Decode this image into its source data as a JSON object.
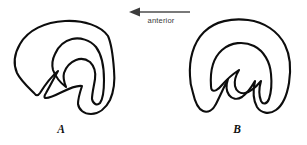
{
  "figure": {
    "background_color": "#ffffff",
    "ink_color": "#0d0d0d",
    "annotation_color": "#3a3a3a",
    "width": 307,
    "height": 145
  },
  "direction_indicator": {
    "label": "anterior",
    "arrow_points": "left",
    "line_x_start": 190,
    "line_x_end": 131,
    "line_y": 12,
    "label_x": 161,
    "label_y": 22
  },
  "panels": [
    {
      "id": "A",
      "label": "A",
      "label_x": 61,
      "label_y": 133,
      "outer_path": "M 108 36 C 101 26 84 20 65 21 C 45 22 28 30 20 44 C 13 56 14 66 17 73 C 21 81 29 88 34 93 C 36 96 38 96 40 93 C 45 85 52 76 58 71 C 53 80 49 88 46 93 C 44 96 44 98 46 98 C 50 98 56 95 62 92 C 70 88 77 85 82 86 C 80 92 78 99 78 104 C 79 110 84 114 91 114 C 99 114 106 108 110 100 C 114 91 115 80 114 70 C 113 56 112 45 108 36 Z",
      "inner_path": "M 96 47 C 90 40 80 37 72 39 C 64 41 58 47 55 54 C 52 60 52 66 53 70 C 56 78 62 84 66 87 C 64 82 63 77 64 73 C 66 67 71 62 76 60 C 81 58 86 59 90 62 C 94 66 96 72 95 79 C 94 86 92 93 92 99 C 93 104 97 106 100 103 C 103 99 104 90 104 80 C 104 68 102 55 96 47 Z"
    },
    {
      "id": "B",
      "label": "B",
      "label_x": 237,
      "label_y": 133,
      "outer_path": "M 190 76 C 189 60 193 43 204 32 C 215 21 232 18 248 20 C 264 22 278 31 285 45 C 291 57 291 70 289 83 C 287 95 283 105 276 110 C 269 115 261 113 257 107 C 253 100 253 90 255 81 C 251 88 246 94 242 97 C 237 100 232 99 229 95 C 226 91 226 85 228 79 C 224 87 220 96 216 104 C 213 110 208 113 203 111 C 198 109 195 102 193 93 C 191 87 190 81 190 76 Z",
      "inner_path": "M 211 86 C 210 72 213 58 222 50 C 231 42 244 41 254 46 C 264 51 270 62 271 74 C 272 84 271 93 269 99 C 267 104 263 105 261 101 C 259 96 259 88 261 81 C 256 87 250 92 245 93 C 240 94 236 91 235 86 C 234 81 236 75 239 70 C 233 74 227 79 222 85 C 218 90 214 92 212 90 C 211 89 211 88 211 86 Z"
    }
  ]
}
